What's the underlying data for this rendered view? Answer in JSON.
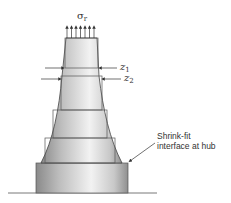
{
  "diagram": {
    "stress_label": {
      "symbol": "σ",
      "subscript": "r"
    },
    "z1_label": {
      "symbol": "z",
      "subscript": "1"
    },
    "z2_label": {
      "symbol": "z",
      "subscript": "2"
    },
    "annotation": {
      "line1": "Shrink-fit",
      "line2": "interface at hub"
    }
  }
}
